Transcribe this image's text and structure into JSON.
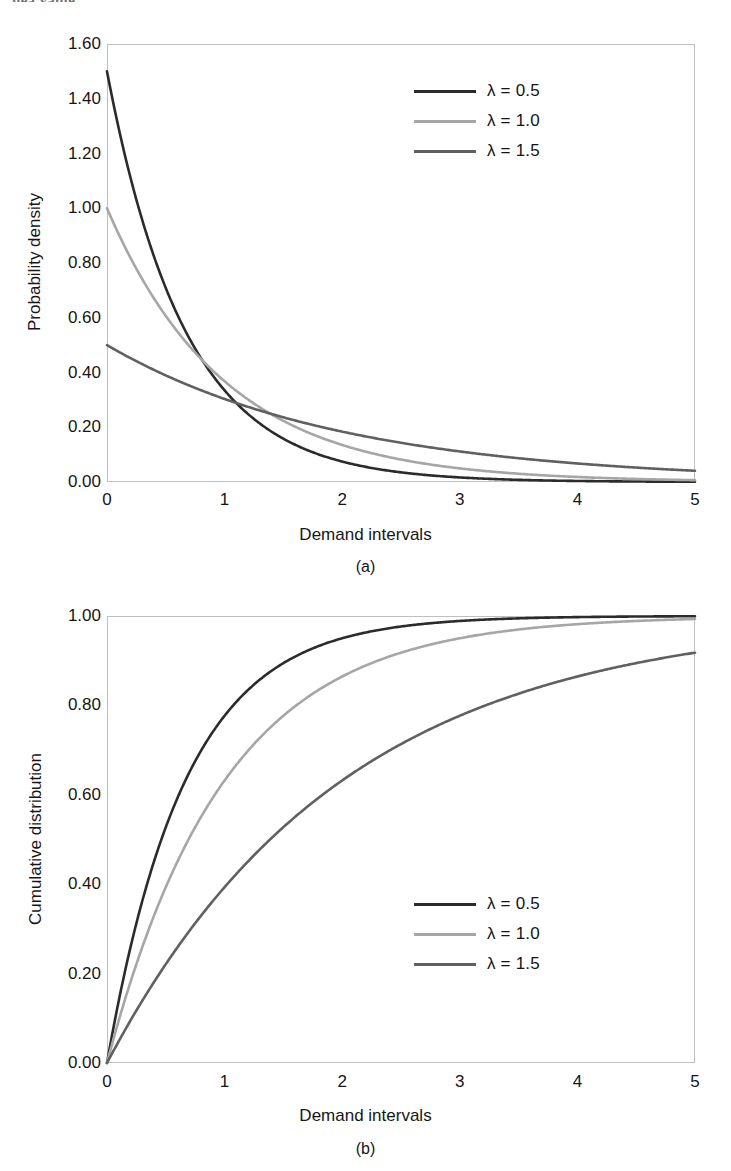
{
  "page": {
    "cut_off_header_text": "nea value."
  },
  "figures": [
    {
      "id": "a",
      "caption": "(a)",
      "xlabel": "Demand intervals",
      "ylabel": "Probability density",
      "xticks": [
        "0",
        "1",
        "2",
        "3",
        "4",
        "5"
      ],
      "yticks": [
        "0.00",
        "0.20",
        "0.40",
        "0.60",
        "0.80",
        "1.00",
        "1.20",
        "1.40",
        "1.60"
      ],
      "legend": [
        {
          "label": "λ = 0.5",
          "color": "#2b2b2b"
        },
        {
          "label": "λ = 1.0",
          "color": "#a6a6a6"
        },
        {
          "label": "λ = 1.5",
          "color": "#606060"
        }
      ]
    },
    {
      "id": "b",
      "caption": "(b)",
      "xlabel": "Demand intervals",
      "ylabel": "Cumulative distribution",
      "xticks": [
        "0",
        "1",
        "2",
        "3",
        "4",
        "5"
      ],
      "yticks": [
        "0.00",
        "0.20",
        "0.40",
        "0.60",
        "0.80",
        "1.00"
      ],
      "legend": [
        {
          "label": "λ = 0.5",
          "color": "#2b2b2b"
        },
        {
          "label": "λ = 1.0",
          "color": "#a6a6a6"
        },
        {
          "label": "λ = 1.5",
          "color": "#606060"
        }
      ]
    }
  ],
  "chart_data": [
    {
      "type": "line",
      "panel": "(a)",
      "title": "",
      "xlabel": "Demand intervals",
      "ylabel": "Probability density",
      "xlim": [
        0,
        5
      ],
      "ylim": [
        0,
        1.6
      ],
      "xticks": [
        0,
        1,
        2,
        3,
        4,
        5
      ],
      "yticks": [
        0.0,
        0.2,
        0.4,
        0.6,
        0.8,
        1.0,
        1.2,
        1.4,
        1.6
      ],
      "grid": false,
      "legend_position": "top-right",
      "x": [
        0,
        0.25,
        0.5,
        0.75,
        1.0,
        1.25,
        1.5,
        1.75,
        2.0,
        2.25,
        2.5,
        2.75,
        3.0,
        3.25,
        3.5,
        3.75,
        4.0,
        4.25,
        4.5,
        4.75,
        5.0
      ],
      "series": [
        {
          "name": "λ = 0.5",
          "color": "#2b2b2b",
          "plotted_rate": 1.5,
          "values": [
            1.5,
            1.03,
            0.71,
            0.49,
            0.33,
            0.23,
            0.16,
            0.11,
            0.075,
            0.051,
            0.035,
            0.024,
            0.017,
            0.011,
            0.008,
            0.005,
            0.004,
            0.003,
            0.002,
            0.001,
            0.001
          ]
        },
        {
          "name": "λ = 1.0",
          "color": "#a6a6a6",
          "plotted_rate": 1.0,
          "values": [
            1.0,
            0.78,
            0.61,
            0.47,
            0.37,
            0.29,
            0.22,
            0.17,
            0.135,
            0.105,
            0.082,
            0.064,
            0.05,
            0.039,
            0.03,
            0.024,
            0.018,
            0.014,
            0.011,
            0.009,
            0.007
          ]
        },
        {
          "name": "λ = 1.5",
          "color": "#606060",
          "plotted_rate": 0.5,
          "values": [
            0.5,
            0.44,
            0.39,
            0.34,
            0.3,
            0.27,
            0.24,
            0.21,
            0.18,
            0.16,
            0.14,
            0.13,
            0.11,
            0.1,
            0.087,
            0.077,
            0.068,
            0.06,
            0.053,
            0.046,
            0.041
          ]
        }
      ]
    },
    {
      "type": "line",
      "panel": "(b)",
      "title": "",
      "xlabel": "Demand intervals",
      "ylabel": "Cumulative distribution",
      "xlim": [
        0,
        5
      ],
      "ylim": [
        0,
        1.0
      ],
      "xticks": [
        0,
        1,
        2,
        3,
        4,
        5
      ],
      "yticks": [
        0.0,
        0.2,
        0.4,
        0.6,
        0.8,
        1.0
      ],
      "grid": false,
      "legend_position": "bottom-right",
      "x": [
        0,
        0.25,
        0.5,
        0.75,
        1.0,
        1.25,
        1.5,
        1.75,
        2.0,
        2.25,
        2.5,
        2.75,
        3.0,
        3.25,
        3.5,
        3.75,
        4.0,
        4.25,
        4.5,
        4.75,
        5.0
      ],
      "series": [
        {
          "name": "λ = 0.5",
          "color": "#2b2b2b",
          "plotted_rate": 1.5,
          "values": [
            0.0,
            0.313,
            0.528,
            0.675,
            0.777,
            0.847,
            0.895,
            0.928,
            0.95,
            0.966,
            0.976,
            0.984,
            0.989,
            0.992,
            0.995,
            0.996,
            0.998,
            0.998,
            0.999,
            0.999,
            0.999
          ]
        },
        {
          "name": "λ = 1.0",
          "color": "#a6a6a6",
          "plotted_rate": 1.0,
          "values": [
            0.0,
            0.221,
            0.393,
            0.528,
            0.632,
            0.713,
            0.777,
            0.826,
            0.865,
            0.895,
            0.918,
            0.936,
            0.95,
            0.961,
            0.97,
            0.976,
            0.982,
            0.986,
            0.989,
            0.991,
            0.993
          ]
        },
        {
          "name": "λ = 1.5",
          "color": "#606060",
          "plotted_rate": 0.5,
          "values": [
            0.0,
            0.118,
            0.221,
            0.313,
            0.393,
            0.465,
            0.528,
            0.583,
            0.632,
            0.675,
            0.713,
            0.747,
            0.777,
            0.803,
            0.826,
            0.847,
            0.865,
            0.881,
            0.895,
            0.907,
            0.918
          ]
        }
      ]
    }
  ]
}
